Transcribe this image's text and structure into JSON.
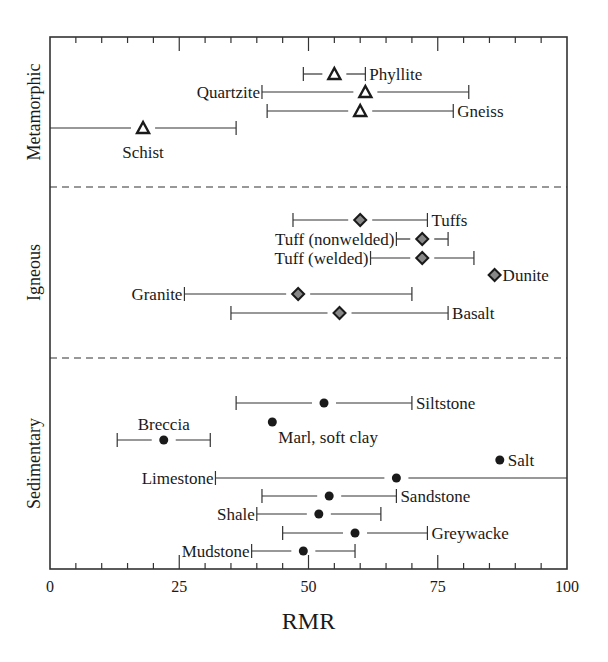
{
  "chart_data": {
    "type": "scatter",
    "subtype": "range-plot-with-center-markers",
    "title": "",
    "xlabel": "RMR",
    "ylabel": "",
    "xlim": [
      0,
      100
    ],
    "x_ticks": [
      0,
      25,
      50,
      75,
      100
    ],
    "x_tick_labels": [
      "0",
      "25",
      "50",
      "75",
      "100"
    ],
    "x_minor_tick_step": 5,
    "grid": false,
    "legend": null,
    "groups": [
      {
        "name": "Metamorphic",
        "marker": "open-triangle",
        "items": [
          {
            "label": "Phyllite",
            "value": 55,
            "min": 49,
            "max": 61,
            "label_pos": "right"
          },
          {
            "label": "Quartzite",
            "value": 61,
            "min": 41,
            "max": 81,
            "label_pos": "left"
          },
          {
            "label": "Gneiss",
            "value": 60,
            "min": 42,
            "max": 78,
            "label_pos": "right"
          },
          {
            "label": "Schist",
            "value": 18,
            "min": 0,
            "max": 36,
            "label_pos": "below"
          }
        ]
      },
      {
        "name": "Igneous",
        "marker": "gray-diamond",
        "items": [
          {
            "label": "Tuffs",
            "value": 60,
            "min": 47,
            "max": 73,
            "label_pos": "right"
          },
          {
            "label": "Tuff (nonwelded)",
            "value": 72,
            "min": 67,
            "max": 77,
            "label_pos": "left"
          },
          {
            "label": "Tuff (welded)",
            "value": 72,
            "min": 62,
            "max": 82,
            "label_pos": "left"
          },
          {
            "label": "Dunite",
            "value": 86,
            "min": null,
            "max": null,
            "label_pos": "right"
          },
          {
            "label": "Granite",
            "value": 48,
            "min": 26,
            "max": 70,
            "label_pos": "left"
          },
          {
            "label": "Basalt",
            "value": 56,
            "min": 35,
            "max": 77,
            "label_pos": "right"
          }
        ]
      },
      {
        "name": "Sedimentary",
        "marker": "filled-circle",
        "items": [
          {
            "label": "Siltstone",
            "value": 53,
            "min": 36,
            "max": 70,
            "label_pos": "right"
          },
          {
            "label": "Breccia",
            "value": 22,
            "min": 13,
            "max": 31,
            "label_pos": "above"
          },
          {
            "label": "Marl, soft clay",
            "value": 43,
            "min": null,
            "max": null,
            "label_pos": "below-right"
          },
          {
            "label": "Salt",
            "value": 87,
            "min": null,
            "max": null,
            "label_pos": "right"
          },
          {
            "label": "Limestone",
            "value": 67,
            "min": 32,
            "max": 100,
            "label_pos": "left"
          },
          {
            "label": "Sandstone",
            "value": 54,
            "min": 41,
            "max": 67,
            "label_pos": "right"
          },
          {
            "label": "Shale",
            "value": 52,
            "min": 40,
            "max": 64,
            "label_pos": "left"
          },
          {
            "label": "Greywacke",
            "value": 59,
            "min": 45,
            "max": 73,
            "label_pos": "right"
          },
          {
            "label": "Mudstone",
            "value": 49,
            "min": 39,
            "max": 59,
            "label_pos": "left"
          }
        ]
      }
    ]
  },
  "colors": {
    "ink": "#1a1a1a",
    "frame": "#333333",
    "diamond_fill": "#888888",
    "background": "#ffffff"
  }
}
